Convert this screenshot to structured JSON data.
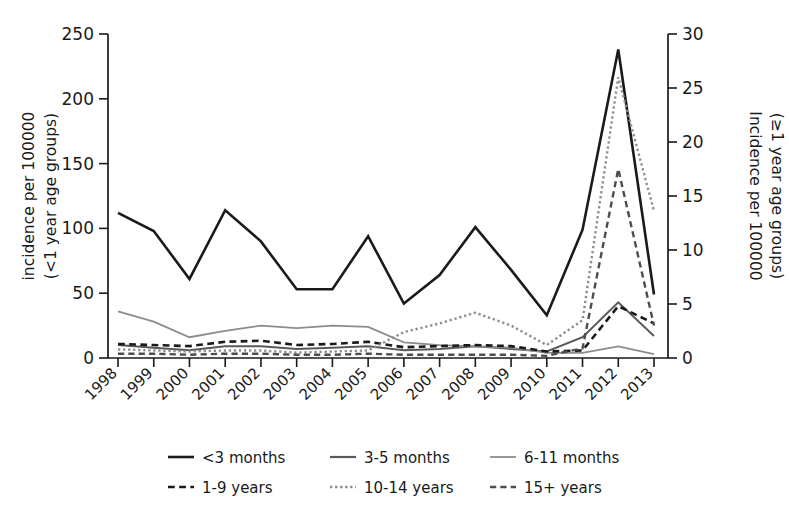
{
  "chart_data": {
    "type": "line",
    "title": "",
    "xlabel": "",
    "ylabel": "incidence per 100000\n(<1 year age groups)",
    "ylabel_left": "incidence per 100000",
    "ylabel_left_2": "(<1 year age groups)",
    "ylabel_right": "Incidence per 100000",
    "ylabel_right_2": "(≥1 year age groups)",
    "x": [
      "1998",
      "1999",
      "2000",
      "2001",
      "2002",
      "2003",
      "2004",
      "2005",
      "2006",
      "2007",
      "2008",
      "2009",
      "2010",
      "2011",
      "2012",
      "2013"
    ],
    "categories": [
      "1998",
      "1999",
      "2000",
      "2001",
      "2002",
      "2003",
      "2004",
      "2005",
      "2006",
      "2007",
      "2008",
      "2009",
      "2010",
      "2011",
      "2012",
      "2013"
    ],
    "ylim": [
      0,
      250
    ],
    "yticks": [
      0,
      50,
      100,
      150,
      200,
      250
    ],
    "ylim_right": [
      0,
      30
    ],
    "yticks_right": [
      0,
      5,
      10,
      15,
      20,
      25,
      30
    ],
    "grid": false,
    "legend_position": "bottom",
    "axis_note": "Series '<3 months','3-5 months','6-11 months' read on left axis; '1-9 years','10-14 years','15+ years' read on right axis (0-30).",
    "series": [
      {
        "name": "<3 months",
        "axis": "left",
        "style": "solid",
        "color": "#1a1a1a",
        "width": 2.6,
        "values": [
          112,
          98,
          61,
          114,
          90,
          53,
          53,
          94,
          42,
          64,
          101,
          68,
          33,
          99,
          238,
          49
        ]
      },
      {
        "name": "3-5 months",
        "axis": "left",
        "style": "solid",
        "color": "#595959",
        "width": 2.0,
        "values": [
          10,
          8,
          6,
          9,
          9,
          7,
          8,
          9,
          6,
          7,
          9,
          7,
          5,
          16,
          43,
          17
        ]
      },
      {
        "name": "6-11 months",
        "axis": "left",
        "style": "solid",
        "color": "#8c8c8c",
        "width": 1.8,
        "values": [
          36,
          28,
          16,
          21,
          25,
          23,
          25,
          24,
          12,
          10,
          9,
          8,
          4,
          4,
          9,
          3
        ]
      },
      {
        "name": "1-9 years",
        "axis": "right",
        "style": "dashed",
        "color": "#1a1a1a",
        "width": 2.6,
        "values": [
          1.3,
          1.2,
          1.1,
          1.5,
          1.6,
          1.2,
          1.3,
          1.5,
          1.0,
          1.1,
          1.2,
          1.1,
          0.6,
          0.7,
          4.8,
          3.2
        ]
      },
      {
        "name": "10-14 years",
        "axis": "right",
        "style": "dotted",
        "color": "#8c8c8c",
        "width": 2.4,
        "values": [
          0.8,
          0.7,
          0.6,
          0.7,
          0.7,
          0.5,
          0.6,
          0.7,
          2.4,
          3.2,
          4.2,
          3.0,
          1.2,
          3.5,
          26.0,
          13.6
        ]
      },
      {
        "name": "15+ years",
        "axis": "right",
        "style": "dashed",
        "color": "#4d4d4d",
        "width": 2.4,
        "values": [
          0.4,
          0.4,
          0.3,
          0.4,
          0.4,
          0.3,
          0.3,
          0.4,
          0.3,
          0.3,
          0.3,
          0.3,
          0.2,
          0.9,
          17.5,
          3.0
        ]
      }
    ],
    "legend": [
      {
        "label": "<3 months",
        "style": "solid",
        "color": "#1a1a1a",
        "width": 2.6
      },
      {
        "label": "3-5 months",
        "style": "solid",
        "color": "#595959",
        "width": 2.2
      },
      {
        "label": "6-11 months",
        "style": "solid",
        "color": "#8c8c8c",
        "width": 1.8
      },
      {
        "label": "1-9 years",
        "style": "dashed",
        "color": "#1a1a1a",
        "width": 2.6
      },
      {
        "label": "10-14 years",
        "style": "dotted",
        "color": "#8c8c8c",
        "width": 2.4
      },
      {
        "label": "15+ years",
        "style": "dashed",
        "color": "#4d4d4d",
        "width": 2.4
      }
    ]
  }
}
